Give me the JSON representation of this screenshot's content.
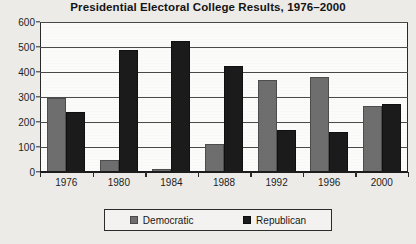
{
  "chart_data": {
    "type": "bar",
    "title": "Presidential Electoral College Results, 1976–2000",
    "xlabel": "",
    "ylabel": "",
    "categories": [
      "1976",
      "1980",
      "1984",
      "1988",
      "1992",
      "1996",
      "2000"
    ],
    "series": [
      {
        "name": "Democratic",
        "color": "#6e6e6e",
        "values": [
          297,
          49,
          13,
          111,
          370,
          379,
          266
        ]
      },
      {
        "name": "Republican",
        "color": "#1b1b1b",
        "values": [
          240,
          489,
          525,
          426,
          168,
          159,
          271
        ]
      }
    ],
    "ylim": [
      0,
      600
    ],
    "yticks": [
      0,
      100,
      200,
      300,
      400,
      500,
      600
    ],
    "ytick_labels": [
      "0",
      "100",
      "200",
      "300",
      "400",
      "500",
      "600"
    ],
    "grid": true,
    "legend_position": "bottom"
  },
  "legend": {
    "items": [
      {
        "label": "Democratic"
      },
      {
        "label": "Republican"
      }
    ]
  }
}
